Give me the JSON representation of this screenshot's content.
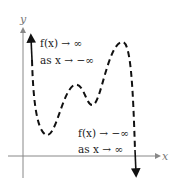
{
  "diagram": {
    "axes": {
      "x_label": "x",
      "y_label": "y"
    },
    "annotations": {
      "left_line1": "f(x) → ∞",
      "left_line2": "as x → −∞",
      "right_line1": "f(x) → −∞",
      "right_line2": "as x → ∞"
    },
    "curve": {
      "style": "dashed",
      "color": "#111111",
      "description": "polynomial curve rising to ∞ on the left and falling to −∞ on the right, with two local maxima and two local minima"
    }
  }
}
